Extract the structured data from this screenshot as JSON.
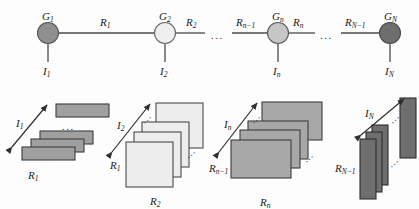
{
  "figure": {
    "type": "diagram",
    "background_color": "#fdfdfd",
    "line_color": "#4a4a4a",
    "text_color": "#1a1a1a"
  },
  "graph": {
    "nodes": [
      {
        "id": "G1",
        "label": "G",
        "sub": "1",
        "cx": 48,
        "cy": 33,
        "r": 10.5,
        "fill": "#8f8f8f",
        "stroke": "#555555"
      },
      {
        "id": "G2",
        "label": "G",
        "sub": "2",
        "cx": 165,
        "cy": 33,
        "r": 10.5,
        "fill": "#efefef",
        "stroke": "#666666"
      },
      {
        "id": "Gn",
        "label": "G",
        "sub": "n",
        "cx": 278,
        "cy": 33,
        "r": 10.5,
        "fill": "#c6c6c6",
        "stroke": "#5a5a5a"
      },
      {
        "id": "GN",
        "label": "G",
        "sub": "N",
        "cx": 390,
        "cy": 33,
        "r": 10.5,
        "fill": "#6e6e6e",
        "stroke": "#4a4a4a"
      }
    ],
    "edges": [
      {
        "id": "R1",
        "label": "R",
        "sub": "1",
        "x1": 58.5,
        "y1": 33,
        "x2": 154.5,
        "y2": 33,
        "label_x": 100,
        "label_y": 17
      },
      {
        "id": "R2",
        "label": "R",
        "sub": "2",
        "x1": 175.5,
        "y1": 33,
        "x2": 205,
        "y2": 33,
        "label_x": 186,
        "label_y": 17
      },
      {
        "id": "Rn-1",
        "label": "R",
        "sub": "n−1",
        "x1": 232,
        "y1": 33,
        "x2": 267.5,
        "y2": 33,
        "label_x": 236,
        "label_y": 17
      },
      {
        "id": "Rn",
        "label": "R",
        "sub": "n",
        "x1": 288.5,
        "y1": 33,
        "x2": 315,
        "y2": 33,
        "label_x": 293,
        "label_y": 17
      },
      {
        "id": "RN-1",
        "label": "R",
        "sub": "N−1",
        "x1": 341,
        "y1": 33,
        "x2": 379.5,
        "y2": 33,
        "label_x": 345,
        "label_y": 17
      }
    ],
    "stubs": [
      {
        "id": "I1",
        "label": "I",
        "sub": "1",
        "x": 48,
        "y1": 43.5,
        "y2": 62,
        "label_x": 43,
        "label_y": 66
      },
      {
        "id": "I2",
        "label": "I",
        "sub": "2",
        "x": 165,
        "y1": 43.5,
        "y2": 62,
        "label_x": 160,
        "label_y": 66
      },
      {
        "id": "In",
        "label": "I",
        "sub": "n",
        "x": 278,
        "y1": 43.5,
        "y2": 62,
        "label_x": 273,
        "label_y": 66
      },
      {
        "id": "IN",
        "label": "I",
        "sub": "N",
        "x": 390,
        "y1": 43.5,
        "y2": 62,
        "label_x": 385,
        "label_y": 66
      }
    ],
    "chain_ellipses": [
      {
        "id": "chain-gap-1",
        "x": 211,
        "y": 30,
        "text": "..."
      },
      {
        "id": "chain-gap-2",
        "x": 320,
        "y": 30,
        "text": "..."
      }
    ]
  },
  "stacks": [
    {
      "id": "stack-1",
      "arrow": {
        "label": "I",
        "sub": "1",
        "x1": 12,
        "y1": 147,
        "x2": 47,
        "y2": 105,
        "label_x": 16,
        "label_y": 118
      },
      "left_label": {
        "text": "R",
        "sub": "1",
        "x": 28,
        "y": 170
      },
      "bottom_label": null,
      "plate": {
        "w": 53,
        "h": 13,
        "fill": "#a0a0a0",
        "stroke": "#3c3c3c"
      },
      "plates": [
        {
          "x": 56,
          "y": 104
        },
        {
          "x": 40,
          "y": 131
        },
        {
          "x": 31,
          "y": 139
        },
        {
          "x": 22,
          "y": 147
        }
      ],
      "detached_index": 0,
      "gap_ellipsis": {
        "x": 62,
        "y": 121,
        "text": "..."
      },
      "slant_ellipsis": null
    },
    {
      "id": "stack-2",
      "arrow": {
        "label": "I",
        "sub": "2",
        "x1": 112,
        "y1": 152,
        "x2": 150,
        "y2": 104,
        "label_x": 117,
        "label_y": 120
      },
      "left_label": {
        "text": "R",
        "sub": "1",
        "x": 110,
        "y": 160
      },
      "bottom_label": {
        "text": "R",
        "sub": "2",
        "x": 150,
        "y": 196
      },
      "plate": {
        "w": 47,
        "h": 45,
        "fill": "#ededed",
        "stroke": "#4a4a4a"
      },
      "plates": [
        {
          "x": 156,
          "y": 103
        },
        {
          "x": 142,
          "y": 122
        },
        {
          "x": 134,
          "y": 132
        },
        {
          "x": 126,
          "y": 142
        }
      ],
      "detached_index": 0,
      "gap_ellipsis": null,
      "slant_ellipsis": [
        {
          "x": 141,
          "y": 113
        },
        {
          "x": 185,
          "y": 148
        }
      ]
    },
    {
      "id": "stack-3",
      "arrow": {
        "label": "I",
        "sub": "n",
        "x1": 219,
        "y1": 152,
        "x2": 257,
        "y2": 103,
        "label_x": 224,
        "label_y": 119
      },
      "left_label": {
        "text": "R",
        "sub": "n−1",
        "x": 209,
        "y": 163
      },
      "bottom_label": {
        "text": "R",
        "sub": "n",
        "x": 260,
        "y": 197
      },
      "plate": {
        "w": 60,
        "h": 38,
        "fill": "#a8a8a8",
        "stroke": "#3c3c3c"
      },
      "plates": [
        {
          "x": 262,
          "y": 102
        },
        {
          "x": 248,
          "y": 121
        },
        {
          "x": 240,
          "y": 130
        },
        {
          "x": 231,
          "y": 140
        }
      ],
      "detached_index": 0,
      "gap_ellipsis": null,
      "slant_ellipsis": [
        {
          "x": 250,
          "y": 113
        },
        {
          "x": 303,
          "y": 152
        }
      ]
    },
    {
      "id": "stack-4",
      "arrow": {
        "label": "I",
        "sub": "N",
        "x1": 361,
        "y1": 135,
        "x2": 404,
        "y2": 99,
        "label_x": 365,
        "label_y": 108
      },
      "left_label": {
        "text": "R",
        "sub": "N−1",
        "x": 335,
        "y": 163
      },
      "bottom_label": null,
      "plate": {
        "w": 16,
        "h": 60,
        "fill": "#6e6e6e",
        "stroke": "#2e2e2e"
      },
      "plates": [
        {
          "x": 400,
          "y": 98
        },
        {
          "x": 372,
          "y": 125
        },
        {
          "x": 366,
          "y": 132
        },
        {
          "x": 360,
          "y": 139
        }
      ],
      "detached_index": 0,
      "gap_ellipsis": null,
      "slant_ellipsis": [
        {
          "x": 389,
          "y": 113
        },
        {
          "x": 388,
          "y": 157
        }
      ]
    }
  ]
}
